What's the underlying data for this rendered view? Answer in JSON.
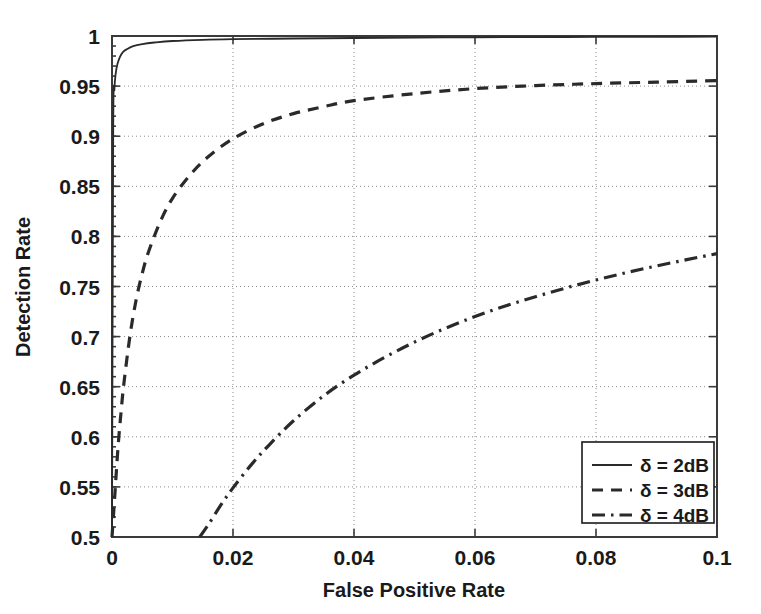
{
  "chart_data": {
    "type": "line",
    "title": "",
    "xlabel": "False Positive Rate",
    "ylabel": "Detection Rate",
    "xlim": [
      0,
      0.1
    ],
    "ylim": [
      0.5,
      1
    ],
    "grid": true,
    "legend_position": "lower-right",
    "xticks": [
      "0",
      "0.02",
      "0.04",
      "0.06",
      "0.08",
      "0.1"
    ],
    "xtick_values": [
      0,
      0.02,
      0.04,
      0.06,
      0.08,
      0.1
    ],
    "yticks": [
      "0.5",
      "0.55",
      "0.6",
      "0.65",
      "0.7",
      "0.75",
      "0.8",
      "0.85",
      "0.9",
      "0.95",
      "1"
    ],
    "ytick_values": [
      0.5,
      0.55,
      0.6,
      0.65,
      0.7,
      0.75,
      0.8,
      0.85,
      0.9,
      0.95,
      1
    ],
    "series": [
      {
        "name": "δ = 2dB",
        "style": "solid",
        "color": "#2a2a2a",
        "x": [
          0,
          0.0002,
          0.0004,
          0.0006,
          0.0009,
          0.0013,
          0.0018,
          0.0025,
          0.0035,
          0.005,
          0.007,
          0.01,
          0.015,
          0.02,
          0.03,
          0.04,
          0.05,
          0.06,
          0.07,
          0.08,
          0.09,
          0.1
        ],
        "y": [
          0.5,
          0.905,
          0.947,
          0.962,
          0.972,
          0.979,
          0.984,
          0.987,
          0.99,
          0.992,
          0.9935,
          0.995,
          0.9962,
          0.9968,
          0.9975,
          0.998,
          0.9984,
          0.9987,
          0.9989,
          0.9991,
          0.9992,
          0.9993
        ]
      },
      {
        "name": "δ = 3dB",
        "style": "dashed",
        "color": "#2a2a2a",
        "x": [
          0,
          0.0005,
          0.001,
          0.0015,
          0.002,
          0.003,
          0.004,
          0.005,
          0.006,
          0.008,
          0.01,
          0.013,
          0.016,
          0.02,
          0.025,
          0.03,
          0.035,
          0.04,
          0.05,
          0.06,
          0.07,
          0.08,
          0.09,
          0.1
        ],
        "y": [
          0.5,
          0.545,
          0.59,
          0.625,
          0.655,
          0.702,
          0.737,
          0.763,
          0.784,
          0.815,
          0.838,
          0.862,
          0.88,
          0.8975,
          0.9125,
          0.9225,
          0.9295,
          0.9355,
          0.9425,
          0.9475,
          0.9505,
          0.9525,
          0.954,
          0.9555
        ]
      },
      {
        "name": "δ = 4dB",
        "style": "dashdot",
        "color": "#2a2a2a",
        "x": [
          0.0145,
          0.016,
          0.018,
          0.02,
          0.023,
          0.026,
          0.03,
          0.035,
          0.04,
          0.045,
          0.05,
          0.055,
          0.06,
          0.065,
          0.07,
          0.075,
          0.08,
          0.085,
          0.09,
          0.095,
          0.1
        ],
        "y": [
          0.5,
          0.513,
          0.532,
          0.549,
          0.572,
          0.592,
          0.616,
          0.641,
          0.6615,
          0.679,
          0.6945,
          0.708,
          0.72,
          0.7305,
          0.7398,
          0.7485,
          0.7565,
          0.7638,
          0.7705,
          0.7768,
          0.7828
        ]
      }
    ]
  },
  "axes": {
    "xlabel": "False Positive Rate",
    "ylabel": "Detection Rate"
  },
  "legend": {
    "entries": [
      {
        "label": "δ = 2dB",
        "style": "solid"
      },
      {
        "label": "δ = 3dB",
        "style": "dashed"
      },
      {
        "label": "δ = 4dB",
        "style": "dashdot"
      }
    ]
  }
}
